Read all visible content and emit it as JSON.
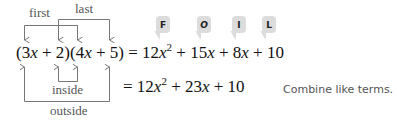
{
  "labels": {
    "first": "first",
    "last": "last",
    "inside": "inside",
    "outside": "outside"
  },
  "foil_bubbles": [
    "F",
    "O",
    "I",
    "L"
  ],
  "equation": {
    "lhs": {
      "p1": "(3",
      "v1": "x",
      "p2": " + 2)(4",
      "v2": "x",
      "p3": " + 5)"
    },
    "line1": {
      "a": " = 12",
      "v1": "x",
      "exp": "2",
      "b": " + 15",
      "v2": "x",
      "c": " + 8",
      "v3": "x",
      "d": " + 10"
    },
    "line2": {
      "a": "= 12",
      "v1": "x",
      "exp": "2",
      "b": " + 23",
      "v2": "x",
      "c": " + 10"
    }
  },
  "note": "Combine like terms.",
  "colors": {
    "bubble": "#dcdcdc",
    "lines": "#777777",
    "text": "#111111"
  }
}
